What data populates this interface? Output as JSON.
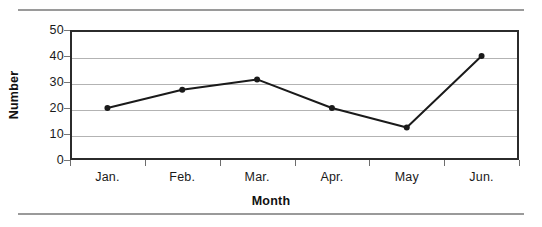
{
  "chart_data": {
    "type": "line",
    "title": "",
    "categories": [
      "Jan.",
      "Feb.",
      "Mar.",
      "Apr.",
      "May",
      "Jun."
    ],
    "values": [
      20,
      27,
      31,
      20,
      12.5,
      40
    ],
    "series": [
      {
        "name": "Number",
        "values": [
          20,
          27,
          31,
          20,
          12.5,
          40
        ]
      }
    ],
    "xlabel": "Month",
    "ylabel": "Number",
    "ylim": [
      0,
      50
    ],
    "yticks": [
      0,
      10,
      20,
      30,
      40,
      50
    ],
    "ytick_labels": [
      "0",
      "10",
      "20",
      "30",
      "40",
      "50"
    ],
    "grid": "horizontal",
    "legend": "none",
    "line_color": "#1a1a1a",
    "marker": "circle",
    "marker_color": "#1a1a1a",
    "frame_color": "#2b2b2b",
    "gridline_color": "#b3b3b3",
    "background": "#ffffff"
  },
  "decorations": {
    "top_rule_color": "#9a9a9a",
    "bottom_rule_color": "#9a9a9a"
  }
}
